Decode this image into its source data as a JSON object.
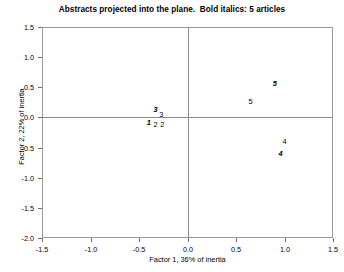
{
  "chart_data": {
    "type": "scatter",
    "title": "Abstracts projected into the plane.  Bold italics: 5 articles",
    "xlabel": "Factor 1, 36% of inertia",
    "ylabel": "Factor 2, 22% of inertia",
    "xlim": [
      -1.5,
      1.5
    ],
    "ylim": [
      -2.0,
      1.5
    ],
    "xticks": [
      "-1.5",
      "-1.0",
      "-0.5",
      "0.0",
      "0.5",
      "1.0",
      "1.5"
    ],
    "xtick_values": [
      -1.5,
      -1.0,
      -0.5,
      0.0,
      0.5,
      1.0,
      1.5
    ],
    "yticks": [
      "1.5",
      "1.0",
      "0.5",
      "0.0",
      "-0.5",
      "-1.0",
      "-1.5",
      "-2.0"
    ],
    "ytick_values": [
      1.5,
      1.0,
      0.5,
      0.0,
      -0.5,
      -1.0,
      -1.5,
      -2.0
    ],
    "grid": false,
    "legend": null,
    "reference_lines": {
      "horizontal": 0.0,
      "vertical": 0.0
    },
    "marker_style": "text-label",
    "points": [
      {
        "label": "3",
        "x": -0.33,
        "y": 0.12,
        "bold_italic": true
      },
      {
        "label": "3",
        "x": -0.27,
        "y": 0.04,
        "bold_italic": false
      },
      {
        "label": "1",
        "x": -0.4,
        "y": -0.09,
        "bold_italic": true
      },
      {
        "label": "2",
        "x": -0.33,
        "y": -0.12,
        "bold_italic": false
      },
      {
        "label": "2",
        "x": -0.26,
        "y": -0.13,
        "bold_italic": false
      },
      {
        "label": "5",
        "x": 0.9,
        "y": 0.56,
        "bold_italic": true
      },
      {
        "label": "5",
        "x": 0.65,
        "y": 0.25,
        "bold_italic": false
      },
      {
        "label": "4",
        "x": 1.0,
        "y": -0.4,
        "bold_italic": false
      },
      {
        "label": "4",
        "x": 0.96,
        "y": -0.61,
        "bold_italic": true
      }
    ]
  }
}
